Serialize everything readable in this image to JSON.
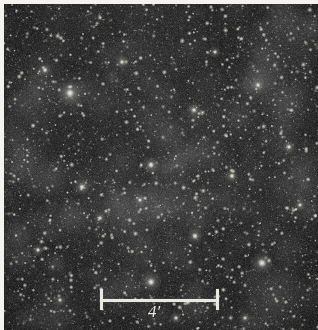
{
  "figure": {
    "kind": "astronomical-star-field-photograph",
    "width": 318,
    "height": 330,
    "caption_text": ""
  },
  "field": {
    "background_color": "#262626",
    "star_color": "#d8d8d2",
    "bright_star_color": "#f4f4ee",
    "margin_color": "#f4f3f0",
    "description": "Dense Milky Way star field, monochrome photographic plate"
  },
  "scalebar": {
    "label": "4'",
    "label_value": "4",
    "label_unit": "'",
    "color": "#e9e9e4",
    "left_x": 100,
    "right_x": 219,
    "bar_y": 299,
    "bar_thickness": 3,
    "tick_top": 289,
    "tick_bottom": 310,
    "tick_thickness": 3,
    "label_x": 148,
    "label_y": 303
  },
  "bright_stars": [
    {
      "x": 70,
      "y": 93,
      "r": 4.2
    },
    {
      "x": 262,
      "y": 263,
      "r": 4.0
    },
    {
      "x": 151,
      "y": 282,
      "r": 3.6
    },
    {
      "x": 151,
      "y": 165,
      "r": 3.0
    },
    {
      "x": 195,
      "y": 236,
      "r": 2.8
    },
    {
      "x": 82,
      "y": 187,
      "r": 2.7
    },
    {
      "x": 232,
      "y": 176,
      "r": 2.6
    },
    {
      "x": 194,
      "y": 110,
      "r": 2.5
    },
    {
      "x": 45,
      "y": 70,
      "r": 2.4
    },
    {
      "x": 289,
      "y": 147,
      "r": 2.4
    },
    {
      "x": 122,
      "y": 62,
      "r": 2.3
    },
    {
      "x": 258,
      "y": 85,
      "r": 2.3
    },
    {
      "x": 38,
      "y": 250,
      "r": 2.2
    },
    {
      "x": 176,
      "y": 318,
      "r": 2.2
    },
    {
      "x": 100,
      "y": 218,
      "r": 2.1
    },
    {
      "x": 215,
      "y": 52,
      "r": 2.1
    },
    {
      "x": 300,
      "y": 205,
      "r": 2.0
    },
    {
      "x": 140,
      "y": 200,
      "r": 2.0
    },
    {
      "x": 60,
      "y": 300,
      "r": 2.0
    },
    {
      "x": 245,
      "y": 318,
      "r": 1.9
    }
  ],
  "star_field_params": {
    "faint_star_count": 5200,
    "mid_star_count": 900,
    "seed": 20240617
  }
}
